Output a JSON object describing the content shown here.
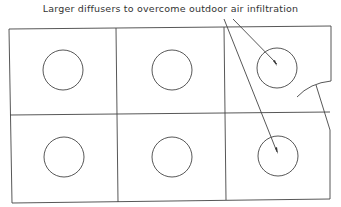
{
  "diagram": {
    "title": "Larger diffusers to overcome outdoor air infiltration",
    "grid": {
      "rows": 2,
      "cols": 3
    },
    "diffusers": [
      {
        "row": 0,
        "col": 0,
        "type": "standard"
      },
      {
        "row": 0,
        "col": 1,
        "type": "standard"
      },
      {
        "row": 0,
        "col": 2,
        "type": "larger"
      },
      {
        "row": 1,
        "col": 0,
        "type": "standard"
      },
      {
        "row": 1,
        "col": 1,
        "type": "standard"
      },
      {
        "row": 1,
        "col": 2,
        "type": "larger"
      }
    ],
    "annotation_targets": [
      "diffuser-r0c2",
      "diffuser-r1c2"
    ],
    "colors": {
      "line": "#444444",
      "background": "#ffffff"
    }
  }
}
